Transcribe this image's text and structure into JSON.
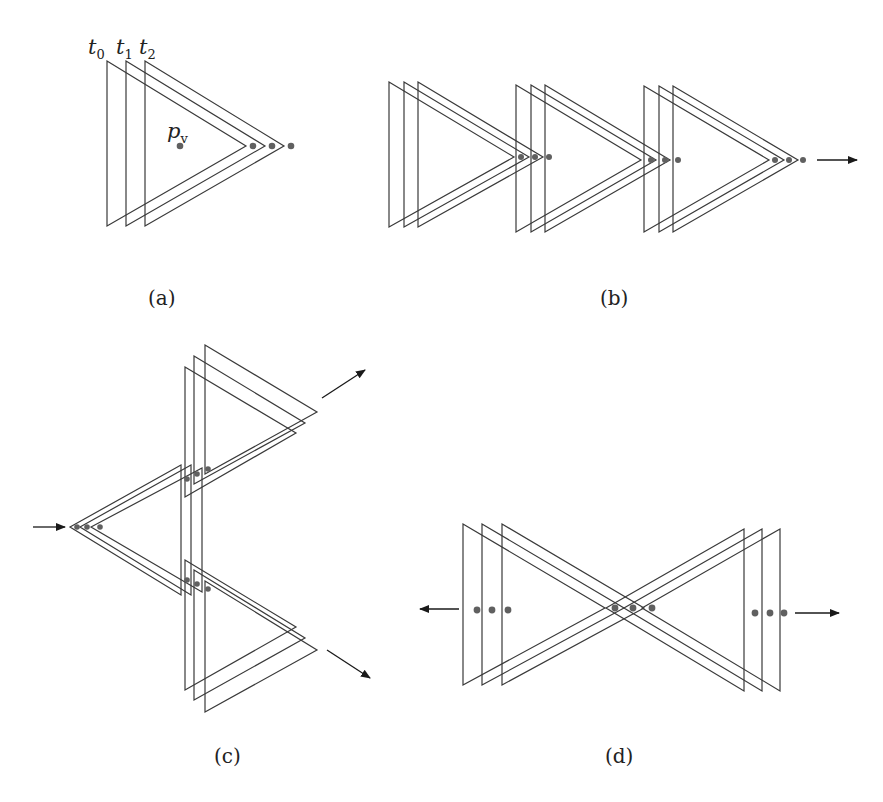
{
  "figure": {
    "panels": [
      {
        "id": "a",
        "caption": "(a)"
      },
      {
        "id": "b",
        "caption": "(b)"
      },
      {
        "id": "c",
        "caption": "(c)"
      },
      {
        "id": "d",
        "caption": "(d)"
      }
    ],
    "panel_a": {
      "time_labels": [
        {
          "base": "t",
          "sub": "0"
        },
        {
          "base": "t",
          "sub": "1"
        },
        {
          "base": "t",
          "sub": "2"
        }
      ],
      "point_label": {
        "base": "p",
        "sub": "v"
      }
    },
    "colors": {
      "stroke": "#3a3a3a",
      "dot": "#606060",
      "arrow": "#1a1a1a",
      "background": "#ffffff"
    }
  }
}
